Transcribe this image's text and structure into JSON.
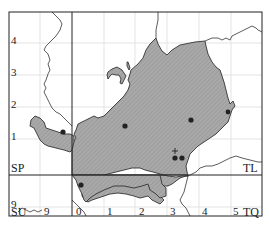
{
  "map": {
    "type": "distribution-map",
    "colors": {
      "frame": "#222222",
      "grid": "#e2e2e2",
      "fill": "#a9a9a9",
      "hatch": "#8c8c8c",
      "outline": "#333333",
      "dot": "#222222"
    },
    "grid_squares": {
      "SP": "SP",
      "TL": "TL",
      "SU": "SU",
      "TQ": "TQ"
    },
    "y_ticks": [
      "4",
      "3",
      "2",
      "1",
      "9"
    ],
    "x_ticks": [
      "9",
      "0",
      "1",
      "2",
      "3",
      "4",
      "5"
    ],
    "records": [
      {
        "type": "dot",
        "x": 63,
        "y": 132
      },
      {
        "type": "dot",
        "x": 125,
        "y": 126
      },
      {
        "type": "dot",
        "x": 191,
        "y": 120
      },
      {
        "type": "dot",
        "x": 175,
        "y": 158
      },
      {
        "type": "dot",
        "x": 182,
        "y": 158
      },
      {
        "type": "dot",
        "x": 81,
        "y": 185
      },
      {
        "type": "dot",
        "x": 228,
        "y": 112
      },
      {
        "type": "cross",
        "x": 175,
        "y": 151
      }
    ]
  }
}
